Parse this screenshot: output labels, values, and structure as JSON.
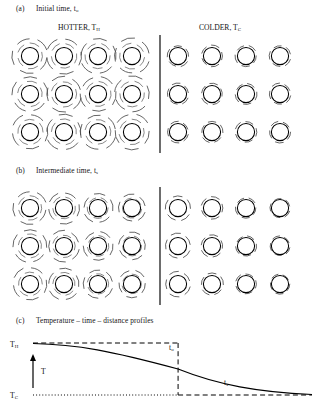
{
  "figure": {
    "panels": [
      {
        "tag": "(a)",
        "title": "Initial time, t",
        "title_sub": "o"
      },
      {
        "tag": "(b)",
        "title": "Intermediate time, t",
        "title_sub": "s"
      },
      {
        "tag": "(c)",
        "title": "Temperature – time – distance profiles",
        "title_sub": ""
      }
    ],
    "lattice_headers": {
      "hot_label": "HOTTER, T",
      "hot_sub": "H",
      "cold_label": "COLDER, T",
      "cold_sub": "C"
    },
    "lattice": {
      "rows": 3,
      "hot_columns": 4,
      "cold_columns": 4,
      "atom_radius": 8.6,
      "hot_vibration_radius": 17.5,
      "cold_vibration_radius": 10.6,
      "divider_x": 160
    },
    "panel_b_gradient": {
      "description": "vibration amplitude decreases from left (hot) to right (cold)",
      "hot_amplitudes": [
        16.5,
        15.5,
        14.5,
        13.5
      ],
      "cold_amplitudes": [
        12.5,
        11.0,
        10.2,
        9.8
      ]
    },
    "graph": {
      "y_top_label": "T",
      "y_top_sub": "H",
      "y_bottom_label": "T",
      "y_bottom_sub": "C",
      "y_axis_arrow_label": "T",
      "curve_label_initial": "t",
      "curve_label_initial_sub": "o",
      "curve_label_steady": "t",
      "curve_label_steady_sub": "s",
      "x_marker_fraction": 0.52,
      "profile_points": "flat at T_H then sigmoidal decay toward T_C"
    },
    "colors": {
      "atom_stroke": "#000000",
      "vibration_stroke": "#4a4a4a",
      "divider": "#000000",
      "background": "#ffffff",
      "text": "#111111"
    }
  }
}
